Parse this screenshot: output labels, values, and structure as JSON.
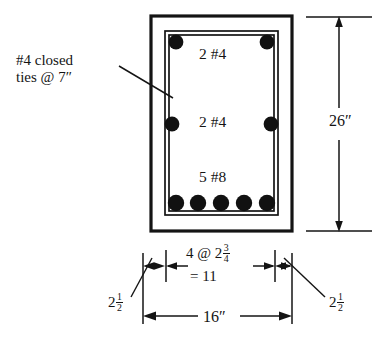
{
  "diagram": {
    "colors": {
      "line": "#141414",
      "rebar": "#111111",
      "background": "#ffffff"
    },
    "annotations": {
      "ties_line1": "#4 closed",
      "ties_line2": "ties @ 7″",
      "top_bars": "2 #4",
      "middle_bars": "2 #4",
      "bottom_bars": "5 #8",
      "height": "26″",
      "width": "16″",
      "spacing_prefix": "4 @ 2",
      "spacing_numerator": "3",
      "spacing_denominator": "4",
      "spacing_total": "= 11",
      "cover_left_whole": "2",
      "cover_left_numerator": "1",
      "cover_left_denominator": "2",
      "cover_right_whole": "2",
      "cover_right_numerator": "1",
      "cover_right_denominator": "2"
    }
  }
}
